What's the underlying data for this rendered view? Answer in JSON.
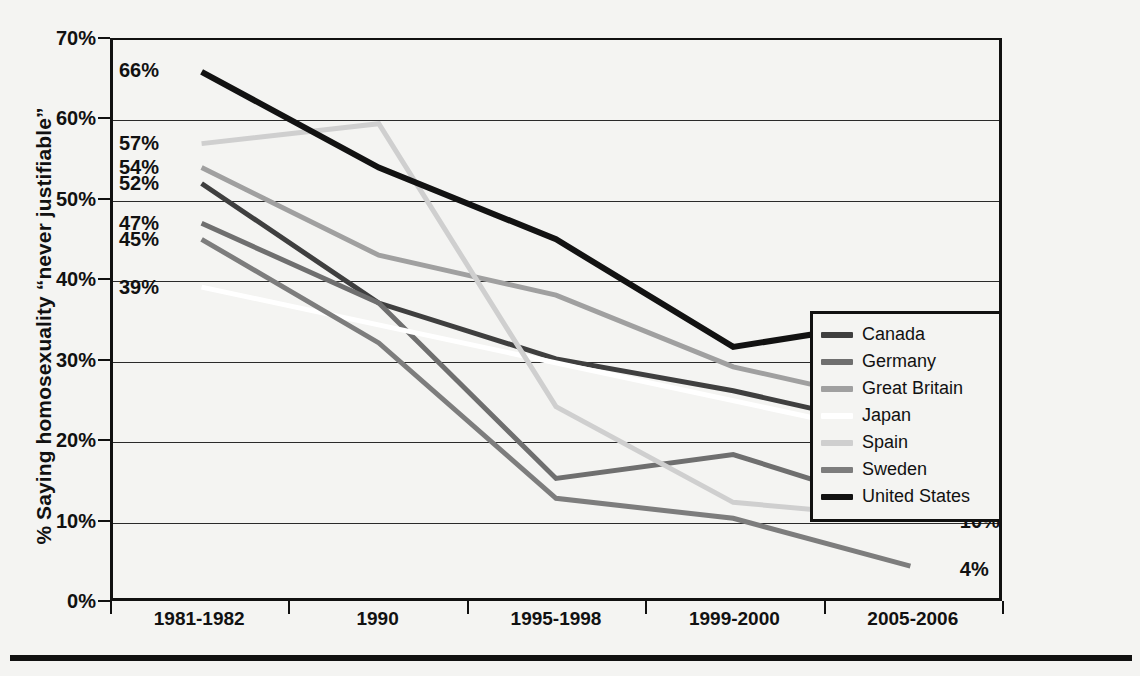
{
  "chart_data": {
    "type": "line",
    "title": "",
    "xlabel": "",
    "ylabel": "% Saying homosexuality “never justifiable”",
    "categories": [
      "1981-1982",
      "1990",
      "1995-1998",
      "1999-2000",
      "2005-2006"
    ],
    "ylim": [
      0,
      70
    ],
    "yticks": [
      0,
      10,
      20,
      30,
      40,
      50,
      60,
      70
    ],
    "ytick_labels": [
      "0%",
      "10%",
      "20%",
      "30%",
      "40%",
      "50%",
      "60%",
      "70%"
    ],
    "grid": true,
    "legend_position": "right-inside",
    "series": [
      {
        "name": "Canada",
        "color": "#3f3f3f",
        "width": 5,
        "values": [
          52,
          37,
          30,
          26,
          21
        ],
        "start_label": "52%",
        "end_label": "21%"
      },
      {
        "name": "Germany",
        "color": "#6f6f6f",
        "width": 5,
        "values": [
          47,
          37,
          15,
          18,
          11
        ],
        "start_label": "47%",
        "end_label": "11%"
      },
      {
        "name": "Great Britain",
        "color": "#a0a0a0",
        "width": 5,
        "values": [
          54,
          43,
          38,
          29,
          24
        ],
        "start_label": "54%",
        "end_label": "24%"
      },
      {
        "name": "Japan",
        "color": "#ffffff",
        "width": 5,
        "values": [
          39,
          null,
          null,
          null,
          20
        ],
        "start_label": "39%",
        "end_label": "20%"
      },
      {
        "name": "Spain",
        "color": "#cfcfcf",
        "width": 5,
        "values": [
          57,
          59.5,
          24,
          12,
          10
        ],
        "start_label": "57%",
        "end_label": "10%"
      },
      {
        "name": "Sweden",
        "color": "#7d7d7d",
        "width": 5,
        "values": [
          45,
          32,
          12.5,
          10,
          4
        ],
        "start_label": "45%",
        "end_label": "4%"
      },
      {
        "name": "United States",
        "color": "#121212",
        "width": 6,
        "values": [
          66,
          54,
          45,
          31.5,
          35
        ],
        "start_label": "66%",
        "end_label": "35%"
      }
    ],
    "start_labels": [
      {
        "text": "66%",
        "value": 66
      },
      {
        "text": "57%",
        "value": 57
      },
      {
        "text": "54%",
        "value": 54
      },
      {
        "text": "52%",
        "value": 52
      },
      {
        "text": "47%",
        "value": 47
      },
      {
        "text": "45%",
        "value": 45
      },
      {
        "text": "39%",
        "value": 39
      }
    ],
    "end_labels": [
      {
        "text": "35%",
        "value": 35
      },
      {
        "text": "24%",
        "value": 24
      },
      {
        "text": "21%",
        "value": 21
      },
      {
        "text": "20%",
        "value": 20
      },
      {
        "text": "11%",
        "value": 11
      },
      {
        "text": "10%",
        "value": 10
      },
      {
        "text": "4%",
        "value": 4
      }
    ]
  },
  "legend": {
    "items": [
      {
        "label": "Canada"
      },
      {
        "label": "Germany"
      },
      {
        "label": "Great Britain"
      },
      {
        "label": "Japan"
      },
      {
        "label": "Spain"
      },
      {
        "label": "Sweden"
      },
      {
        "label": "United States"
      }
    ]
  }
}
